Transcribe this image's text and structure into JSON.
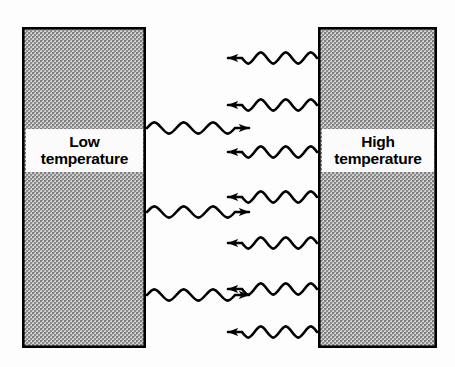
{
  "figure": {
    "background_color": "#fdfdfd"
  },
  "blocks": [
    {
      "id": "low-temperature-block",
      "label_line1": "Low",
      "label_line2": "temperature",
      "fill_color": "#a8a8a8",
      "border_color": "#000000",
      "x": 22,
      "y": 27,
      "width": 124,
      "height": 321
    },
    {
      "id": "high-temperature-block",
      "label_line1": "High",
      "label_line2": "temperature",
      "fill_color": "#a8a8a8",
      "border_color": "#000000",
      "x": 318,
      "y": 27,
      "width": 119,
      "height": 321
    }
  ],
  "waves": {
    "stroke_color": "#000000",
    "stroke_width": 2.6,
    "rightward": {
      "direction": "right",
      "count": 3,
      "description": "radiation emitted by the low temperature body travelling to the right",
      "start_x": 147,
      "end_x": 249,
      "cycles": 3,
      "amplitude": 7.5,
      "y_positions": [
        128,
        212,
        295
      ]
    },
    "leftward": {
      "direction": "left",
      "count": 7,
      "description": "radiation emitted by the high temperature body travelling to the left",
      "start_x": 317,
      "end_x": 228,
      "cycles": 3,
      "amplitude": 7.5,
      "y_positions": [
        58,
        105,
        152,
        197,
        243,
        289,
        332
      ]
    }
  },
  "colors": {
    "block_fill": "#a8a8a8",
    "block_border": "#000000",
    "label_background": "#fbfbfb",
    "label_text": "#000000",
    "wave": "#000000",
    "page_background": "#fdfdfd"
  }
}
